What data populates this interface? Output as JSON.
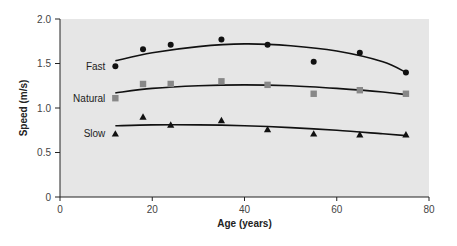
{
  "chart_data": {
    "type": "scatter",
    "title": "",
    "xlabel": "Age (years)",
    "ylabel": "Speed (m/s)",
    "xlim": [
      0,
      80
    ],
    "ylim": [
      0,
      2.0
    ],
    "xticks": [
      0,
      20,
      40,
      60,
      80
    ],
    "yticks": [
      0,
      0.5,
      1.0,
      1.5,
      2.0
    ],
    "xtick_labels": [
      "0",
      "20",
      "40",
      "60",
      "80"
    ],
    "ytick_labels": [
      "0",
      "0.5",
      "1.0",
      "1.5",
      "2.0"
    ],
    "grid": false,
    "legend_position": "inline-left",
    "background": "#e6e6e6",
    "series": [
      {
        "name": "Fast",
        "marker": "circle",
        "color": "#111111",
        "x": [
          12,
          18,
          24,
          35,
          45,
          55,
          65,
          75
        ],
        "values": [
          1.47,
          1.66,
          1.71,
          1.77,
          1.71,
          1.52,
          1.62,
          1.4
        ],
        "trend": {
          "type": "quadratic",
          "x": [
            12,
            20,
            30,
            40,
            50,
            60,
            70,
            75
          ],
          "y": [
            1.53,
            1.62,
            1.69,
            1.72,
            1.7,
            1.64,
            1.52,
            1.4
          ]
        }
      },
      {
        "name": "Natural",
        "marker": "square",
        "color": "#888888",
        "x": [
          12,
          18,
          24,
          35,
          45,
          55,
          65,
          75
        ],
        "values": [
          1.11,
          1.27,
          1.27,
          1.3,
          1.26,
          1.16,
          1.2,
          1.16
        ],
        "trend": {
          "type": "quadratic",
          "x": [
            12,
            20,
            30,
            40,
            50,
            60,
            70,
            75
          ],
          "y": [
            1.17,
            1.22,
            1.25,
            1.26,
            1.25,
            1.22,
            1.18,
            1.15
          ]
        }
      },
      {
        "name": "Slow",
        "marker": "triangle",
        "color": "#111111",
        "x": [
          12,
          18,
          24,
          35,
          45,
          55,
          65,
          75
        ],
        "values": [
          0.71,
          0.9,
          0.81,
          0.86,
          0.76,
          0.71,
          0.7,
          0.7
        ],
        "trend": {
          "type": "quadratic",
          "x": [
            12,
            20,
            30,
            40,
            50,
            60,
            70,
            75
          ],
          "y": [
            0.8,
            0.81,
            0.81,
            0.8,
            0.78,
            0.75,
            0.71,
            0.69
          ]
        }
      }
    ]
  }
}
